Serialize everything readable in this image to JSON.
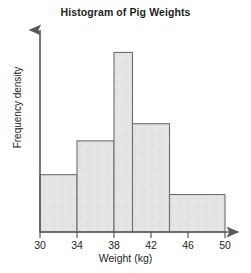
{
  "chart_data": {
    "type": "bar",
    "title": "Histogram of Pig Weights",
    "xlabel": "Weight (kg)",
    "ylabel": "Frequency density",
    "grid": false,
    "legend": null,
    "xlim": [
      30,
      50
    ],
    "ylim": [
      0,
      4.3
    ],
    "xticks": [
      30,
      34,
      38,
      42,
      46,
      50
    ],
    "xtick_labels": [
      "30",
      "34",
      "38",
      "42",
      "46",
      "50"
    ],
    "yticks": [],
    "ytick_labels": [],
    "bin_edges": [
      30,
      34,
      38,
      40,
      44,
      50
    ],
    "categories": [
      "30-34",
      "34-38",
      "38-40",
      "40-44",
      "44-50"
    ],
    "values": [
      1.27,
      2.02,
      3.98,
      2.4,
      0.83
    ],
    "bars": [
      {
        "label": "30-34",
        "x0": 30,
        "x1": 34,
        "density": 1.27
      },
      {
        "label": "34-38",
        "x0": 34,
        "x1": 38,
        "density": 2.02
      },
      {
        "label": "38-40",
        "x0": 38,
        "x1": 40,
        "density": 3.98
      },
      {
        "label": "40-44",
        "x0": 40,
        "x1": 44,
        "density": 2.4
      },
      {
        "label": "44-50",
        "x0": 44,
        "x1": 50,
        "density": 0.83
      }
    ],
    "colors": {
      "bar_fill": "#e4e4e4",
      "bar_stroke": "#6d6e71",
      "axis": "#58595b",
      "text": "#231f20",
      "background": "#ffffff"
    }
  }
}
